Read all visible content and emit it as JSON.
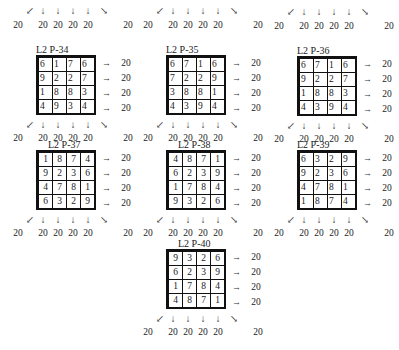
{
  "puzzles": [
    {
      "id": "p34",
      "title": "L2 P-34",
      "grid": [
        [
          6,
          1,
          7,
          6
        ],
        [
          9,
          2,
          2,
          7
        ],
        [
          1,
          8,
          8,
          3
        ],
        [
          4,
          9,
          3,
          4
        ]
      ],
      "row_sums": [
        20,
        20,
        20,
        20
      ],
      "top_sums": {
        "diag_left": 20,
        "cols": [
          20,
          20,
          20,
          20
        ],
        "diag_right": 20
      },
      "bottom_sums": {
        "diag_left": 20,
        "cols": [
          20,
          20,
          20,
          20
        ],
        "diag_right": 20
      },
      "align": "left"
    },
    {
      "id": "p35",
      "title": "L2 P-35",
      "grid": [
        [
          6,
          7,
          1,
          6
        ],
        [
          7,
          2,
          2,
          9
        ],
        [
          3,
          8,
          8,
          1
        ],
        [
          4,
          3,
          9,
          4
        ]
      ],
      "row_sums": [
        20,
        20,
        20,
        20
      ],
      "top_sums": {
        "diag_left": 20,
        "cols": [
          20,
          20,
          20,
          20
        ],
        "diag_right": 20
      },
      "bottom_sums": {
        "diag_left": 20,
        "cols": [
          20,
          20,
          20,
          20
        ],
        "diag_right": 20
      },
      "align": "left"
    },
    {
      "id": "p36",
      "title": "L2 P-36",
      "grid": [
        [
          6,
          7,
          1,
          6
        ],
        [
          9,
          2,
          2,
          7
        ],
        [
          1,
          8,
          8,
          3
        ],
        [
          4,
          3,
          9,
          4
        ]
      ],
      "row_sums": [
        20,
        20,
        20,
        20
      ],
      "top_sums": {
        "diag_left": 20,
        "cols": [
          20,
          20,
          20,
          20
        ],
        "diag_right": 20
      },
      "bottom_sums": {
        "diag_left": 20,
        "cols": [
          20,
          20,
          20,
          20
        ],
        "diag_right": 20
      },
      "align": "left"
    },
    {
      "id": "p37",
      "title": "L2 P-37",
      "grid": [
        [
          1,
          8,
          7,
          4
        ],
        [
          9,
          2,
          3,
          6
        ],
        [
          4,
          7,
          8,
          1
        ],
        [
          6,
          3,
          2,
          9
        ]
      ],
      "row_sums": [
        20,
        20,
        20,
        20
      ],
      "bottom_sums": {
        "diag_left": 20,
        "cols": [
          20,
          20,
          20,
          20
        ],
        "diag_right": 20
      },
      "align": "center"
    },
    {
      "id": "p38",
      "title": "L2 P-38",
      "grid": [
        [
          4,
          8,
          7,
          1
        ],
        [
          6,
          2,
          3,
          9
        ],
        [
          1,
          7,
          8,
          4
        ],
        [
          9,
          3,
          2,
          6
        ]
      ],
      "row_sums": [
        20,
        20,
        20,
        20
      ],
      "bottom_sums": {
        "diag_left": 20,
        "cols": [
          20,
          20,
          20,
          20
        ],
        "diag_right": 20
      },
      "align": "center"
    },
    {
      "id": "p39",
      "title": "L2 P-39",
      "grid": [
        [
          6,
          3,
          2,
          9
        ],
        [
          9,
          2,
          3,
          6
        ],
        [
          4,
          7,
          8,
          1
        ],
        [
          1,
          8,
          7,
          4
        ]
      ],
      "row_sums": [
        20,
        20,
        20,
        20
      ],
      "bottom_sums": {
        "diag_left": 20,
        "cols": [
          20,
          20,
          20,
          20
        ],
        "diag_right": 20
      },
      "align": "left"
    },
    {
      "id": "p40",
      "title": "L2 P-40",
      "grid": [
        [
          9,
          3,
          2,
          6
        ],
        [
          6,
          2,
          3,
          9
        ],
        [
          1,
          7,
          8,
          4
        ],
        [
          4,
          8,
          7,
          1
        ]
      ],
      "row_sums": [
        20,
        20,
        20,
        20
      ],
      "bottom_sums": {
        "diag_left": 20,
        "cols": [
          20,
          20,
          20,
          20
        ],
        "diag_right": 20
      },
      "align": "center"
    }
  ],
  "icons": {
    "arrow_down": "↓",
    "arrow_right": "→",
    "arrow_diag_left": "↙",
    "arrow_diag_right": "↘"
  }
}
